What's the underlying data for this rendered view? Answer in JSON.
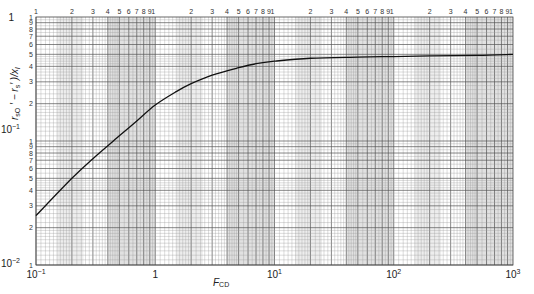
{
  "chart_data": {
    "type": "line",
    "title": "",
    "xlabel": "F_CD",
    "ylabel": "(r_sO' − r_s')/x_l",
    "xscale": "log",
    "yscale": "log",
    "xlim": [
      0.1,
      1000
    ],
    "ylim": [
      0.01,
      1
    ],
    "grid": true,
    "legend": null,
    "x_major_tick_labels": [
      "10^-1",
      "1",
      "10^1",
      "10^2",
      "10^3"
    ],
    "y_major_tick_labels": [
      "10^-2",
      "10^-1",
      "1"
    ],
    "x_minor_tick_labels_top": [
      "1",
      "2",
      "3",
      "4",
      "5",
      "6",
      "7",
      "8",
      "9",
      "1"
    ],
    "y_minor_tick_labels": [
      "1",
      "2",
      "3",
      "4",
      "5",
      "6",
      "7",
      "8",
      "9"
    ],
    "series": [
      {
        "name": "curve",
        "x": [
          0.1,
          0.2,
          0.3,
          0.5,
          0.7,
          1,
          1.5,
          2,
          3,
          5,
          7,
          10,
          20,
          50,
          100,
          200,
          500,
          1000
        ],
        "values": [
          0.025,
          0.05,
          0.072,
          0.11,
          0.145,
          0.195,
          0.25,
          0.29,
          0.34,
          0.39,
          0.42,
          0.44,
          0.465,
          0.475,
          0.48,
          0.485,
          0.49,
          0.5
        ]
      }
    ]
  },
  "labels": {
    "x_title_main": "F",
    "x_title_sub": "CD",
    "y_title": "r",
    "x_major": [
      "10",
      "1",
      "10",
      "10",
      "10"
    ],
    "x_major_exp": [
      "−1",
      "",
      "1",
      "2",
      "3"
    ],
    "y_major": [
      "10",
      "10",
      "1"
    ],
    "y_major_exp": [
      "−2",
      "−1",
      ""
    ]
  }
}
